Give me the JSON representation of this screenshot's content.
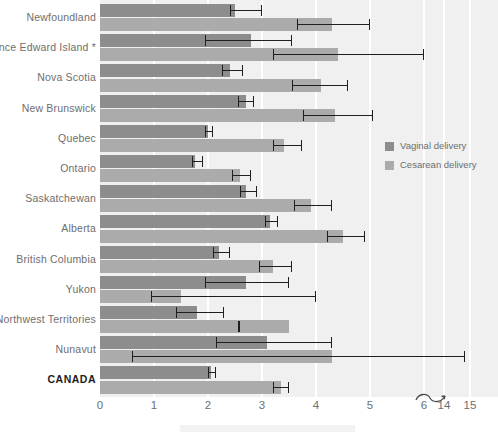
{
  "chart_data": {
    "type": "bar",
    "orientation": "horizontal",
    "title": "",
    "xlabel": "",
    "ylabel": "",
    "grid": true,
    "legend_position": "right",
    "axis_break": {
      "after": 6,
      "before": 14,
      "icon": "axis-break-squiggle"
    },
    "xticks": [
      0,
      1,
      2,
      3,
      4,
      5,
      6,
      14,
      15
    ],
    "xtick_labels": [
      "0",
      "1",
      "2",
      "3",
      "4",
      "5",
      "6",
      "14",
      "15"
    ],
    "xlim": [
      0,
      15
    ],
    "categories": [
      "Newfoundland",
      "Prince Edward Island *",
      "Nova Scotia",
      "New Brunswick",
      "Quebec",
      "Ontario",
      "Saskatchewan",
      "Alberta",
      "British Columbia",
      "Yukon",
      "Northwest Territories",
      "Nunavut",
      "CANADA"
    ],
    "series": [
      {
        "name": "Vaginal delivery",
        "color": "#8d8d8d",
        "values": [
          2.5,
          2.8,
          2.4,
          2.7,
          2.0,
          1.75,
          2.7,
          3.15,
          2.2,
          2.7,
          1.8,
          3.1,
          2.05
        ],
        "ci_low": [
          2.4,
          1.95,
          2.25,
          2.55,
          1.95,
          1.7,
          2.6,
          3.05,
          2.1,
          1.95,
          1.4,
          2.15,
          2.0
        ],
        "ci_high": [
          3.0,
          3.55,
          2.65,
          2.85,
          2.1,
          1.9,
          2.9,
          3.3,
          2.4,
          3.5,
          2.3,
          4.3,
          2.15
        ]
      },
      {
        "name": "Cesarean delivery",
        "color": "#ababab",
        "values": [
          4.3,
          4.4,
          4.1,
          4.35,
          3.4,
          2.6,
          3.9,
          4.5,
          3.2,
          1.5,
          3.5,
          4.3,
          3.35
        ],
        "ci_low": [
          3.65,
          3.2,
          3.55,
          3.75,
          3.2,
          2.45,
          3.6,
          4.2,
          2.95,
          0.95,
          2.55,
          0.6,
          3.2
        ],
        "ci_high": [
          5.0,
          6.0,
          4.6,
          5.05,
          3.75,
          2.8,
          4.3,
          4.9,
          3.55,
          4.0,
          6.1,
          14.8,
          3.5
        ]
      }
    ]
  },
  "legend": {
    "items": [
      {
        "label": "Vaginal delivery",
        "color": "#8d8d8d"
      },
      {
        "label": "Cesarean delivery",
        "color": "#ababab"
      }
    ]
  },
  "colors": {
    "vaginal": "#8d8d8d",
    "cesarean": "#ababab",
    "plot_background": "#f0f0f0",
    "gridline": "#ffffff",
    "error_bar": "#1f1f1f",
    "label_text": "#6e6e6e",
    "emphasis_text": "#1d1d1d"
  }
}
